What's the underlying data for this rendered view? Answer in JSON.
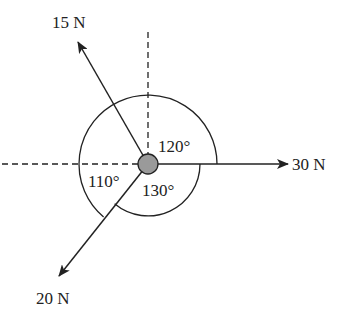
{
  "diagram": {
    "forces": [
      {
        "label": "15 N",
        "magnitude": 15,
        "unit": "N",
        "direction": "upper-left"
      },
      {
        "label": "30 N",
        "magnitude": 30,
        "unit": "N",
        "direction": "right"
      },
      {
        "label": "20 N",
        "magnitude": 20,
        "unit": "N",
        "direction": "lower-left"
      }
    ],
    "angles": [
      {
        "label": "120°",
        "between": [
          "15 N",
          "30 N"
        ]
      },
      {
        "label": "130°",
        "between": [
          "30 N",
          "20 N"
        ]
      },
      {
        "label": "110°",
        "between": [
          "20 N",
          "15 N"
        ]
      }
    ],
    "colors": {
      "line": "#222222",
      "particle": "#9a9a9a"
    }
  }
}
